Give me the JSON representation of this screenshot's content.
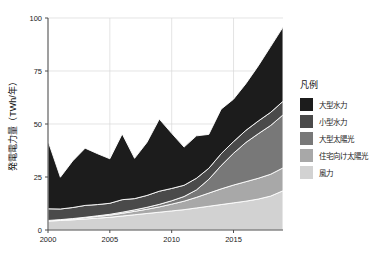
{
  "chart_data": {
    "type": "area",
    "stacked": true,
    "title": "",
    "xlabel": "",
    "ylabel": "発電電力量（TWh/年）",
    "x": [
      2000,
      2001,
      2002,
      2003,
      2004,
      2005,
      2006,
      2007,
      2008,
      2009,
      2010,
      2011,
      2012,
      2013,
      2014,
      2015,
      2016,
      2017,
      2018,
      2019
    ],
    "xlim": [
      2000,
      2019
    ],
    "ylim": [
      0,
      100
    ],
    "xticks": [
      2000,
      2005,
      2010,
      2015
    ],
    "xticklabels": [
      "2000",
      "2005",
      "2010",
      "2015"
    ],
    "yticks": [
      0,
      25,
      50,
      75,
      100
    ],
    "yticklabels": [
      "0",
      "25",
      "50",
      "75",
      "100"
    ],
    "grid": true,
    "legend_position": "right",
    "legend_title": "凡例",
    "stack_order_bottom_to_top": [
      "風力",
      "住宅向け太陽光",
      "大型太陽光",
      "小型水力",
      "大型水力"
    ],
    "series": [
      {
        "name": "大型水力",
        "color": "#1c1c1c",
        "values": [
          32.0,
          15.0,
          22.0,
          27.0,
          24.0,
          21.0,
          31.0,
          19.0,
          25.0,
          34.0,
          26.0,
          18.0,
          20.0,
          16.0,
          21.0,
          20.0,
          22.0,
          26.0,
          31.0,
          35.0
        ]
      },
      {
        "name": "小型水力",
        "color": "#4a4a4a",
        "values": [
          5.5,
          5.0,
          5.2,
          5.6,
          5.3,
          5.2,
          5.9,
          5.3,
          5.6,
          6.2,
          5.8,
          5.3,
          5.5,
          5.2,
          5.6,
          5.5,
          5.7,
          6.0,
          6.2,
          6.4
        ]
      },
      {
        "name": "大型太陽光",
        "color": "#787878",
        "values": [
          0.1,
          0.1,
          0.2,
          0.2,
          0.3,
          0.4,
          0.5,
          0.7,
          0.9,
          1.2,
          1.6,
          2.2,
          3.5,
          6.5,
          11.0,
          15.0,
          18.5,
          21.0,
          23.0,
          25.0
        ]
      },
      {
        "name": "住宅向け太陽光",
        "color": "#a8a8a8",
        "values": [
          0.2,
          0.3,
          0.4,
          0.6,
          0.8,
          1.0,
          1.3,
          1.6,
          2.0,
          2.5,
          3.2,
          4.0,
          5.0,
          6.2,
          7.4,
          8.4,
          9.2,
          9.8,
          10.3,
          10.8
        ]
      },
      {
        "name": "風力",
        "color": "#d2d2d2",
        "values": [
          4.2,
          4.5,
          4.8,
          5.2,
          5.6,
          6.0,
          6.6,
          7.2,
          7.8,
          8.4,
          9.0,
          9.6,
          10.4,
          11.2,
          12.0,
          12.8,
          13.6,
          14.6,
          16.0,
          18.5
        ]
      }
    ],
    "totals": [
      42.0,
      24.9,
      32.6,
      38.6,
      36.0,
      33.6,
      45.3,
      33.8,
      41.3,
      52.3,
      45.6,
      39.1,
      44.4,
      45.1,
      57.0,
      61.7,
      69.0,
      77.4,
      86.5,
      95.7
    ]
  },
  "legend": {
    "title": "凡例",
    "items": [
      {
        "label": "大型水力",
        "color": "#1c1c1c"
      },
      {
        "label": "小型水力",
        "color": "#4a4a4a"
      },
      {
        "label": "大型太陽光",
        "color": "#787878"
      },
      {
        "label": "住宅向け太陽光",
        "color": "#a8a8a8"
      },
      {
        "label": "風力",
        "color": "#d2d2d2"
      }
    ]
  },
  "axes": {
    "y_title": "発電電力量（TWh/年）",
    "y_labels": [
      "100",
      "75",
      "50",
      "25",
      "0"
    ],
    "x_labels": [
      "2000",
      "2005",
      "2010",
      "2015"
    ]
  }
}
